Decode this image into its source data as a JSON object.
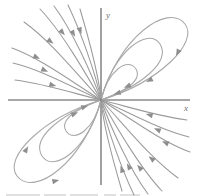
{
  "figure": {
    "axis_labels": {
      "x": "x",
      "y": "y"
    },
    "caption_fragment": ""
  },
  "colors": {
    "background": "#ffffff",
    "axis": "#8a8a8a",
    "trajectory": "#9b9b9b",
    "trajectory_light": "#a8a8a8",
    "arrow": "#8e8e8e",
    "label": "#6f6f6f"
  },
  "chart_data": {
    "type": "line",
    "xlabel": "x",
    "ylabel": "y",
    "grid": false,
    "legend": null,
    "xlim": [
      -1,
      1
    ],
    "ylim": [
      -1,
      1
    ],
    "origin_px": {
      "x": 101,
      "y": 100
    },
    "axes": {
      "x_axis": {
        "x1": 8,
        "y1": 100,
        "x2": 190,
        "y2": 100
      },
      "y_axis": {
        "x1": 101,
        "y1": 8,
        "x2": 101,
        "y2": 185
      }
    },
    "label_positions": {
      "x": {
        "x": 184,
        "y": 111
      },
      "y": {
        "x": 106,
        "y": 18
      }
    },
    "series": [
      {
        "name": "loop-upper-right-outer",
        "kind": "loop",
        "quadrant": "upper-right",
        "path": "M 101 100 C 118 38, 168 2, 185 24 C 199 42, 160 82, 101 100",
        "arrows": [
          {
            "x": 178,
            "y": 52,
            "angle": 118
          },
          {
            "x": 150,
            "y": 80,
            "angle": 152
          }
        ]
      },
      {
        "name": "loop-upper-right-middle",
        "kind": "loop",
        "quadrant": "upper-right",
        "path": "M 101 100 C 113 52, 148 26, 160 44 C 171 62, 141 86, 101 100",
        "arrows": [
          {
            "x": 128,
            "y": 86,
            "angle": 158
          }
        ]
      },
      {
        "name": "loop-upper-right-inner",
        "kind": "loop",
        "quadrant": "upper-right",
        "path": "M 101 100 C 108 70, 128 57, 136 69 C 143 81, 123 92, 101 100",
        "arrows": [
          {
            "x": 118,
            "y": 93,
            "angle": 162
          }
        ]
      },
      {
        "name": "loop-lower-left-outer",
        "kind": "loop",
        "quadrant": "lower-left",
        "path": "M 101 100 C 84 162, 34 198, 17 176 C 3 158, 42 118, 101 100",
        "arrows": [
          {
            "x": 55,
            "y": 181,
            "angle": 348
          },
          {
            "x": 26,
            "y": 150,
            "angle": 300
          }
        ]
      },
      {
        "name": "loop-lower-left-middle",
        "kind": "loop",
        "quadrant": "lower-left",
        "path": "M 101 100 C 89 148, 54 174, 42 156 C 31 138, 61 114, 101 100",
        "arrows": [
          {
            "x": 74,
            "y": 114,
            "angle": 338
          }
        ]
      },
      {
        "name": "loop-lower-left-inner",
        "kind": "loop",
        "quadrant": "lower-left",
        "path": "M 101 100 C 94 130, 74 143, 66 131 C 59 119, 79 108, 101 100",
        "arrows": [
          {
            "x": 84,
            "y": 107,
            "angle": 342
          }
        ]
      },
      {
        "name": "ray-upper-left-1",
        "kind": "ray",
        "quadrant": "upper-left",
        "path": "M 12 48 C 40 58, 72 82, 101 100",
        "arrows": [
          {
            "x": 36,
            "y": 57,
            "angle": 24
          }
        ]
      },
      {
        "name": "ray-upper-left-2",
        "kind": "ray",
        "quadrant": "upper-left",
        "path": "M 13 63 C 42 70, 74 88, 101 100",
        "arrows": [
          {
            "x": 44,
            "y": 70,
            "angle": 22
          }
        ]
      },
      {
        "name": "ray-upper-left-3",
        "kind": "ray",
        "quadrant": "upper-left",
        "path": "M 15 80 C 46 84, 76 94, 101 100",
        "arrows": [
          {
            "x": 52,
            "y": 85,
            "angle": 14
          }
        ]
      },
      {
        "name": "ray-upper-left-4",
        "kind": "ray",
        "quadrant": "upper-left",
        "path": "M 24 22 C 52 42, 80 78, 101 100",
        "arrows": [
          {
            "x": 50,
            "y": 41,
            "angle": 38
          }
        ]
      },
      {
        "name": "ray-upper-left-5",
        "kind": "ray",
        "quadrant": "upper-left",
        "path": "M 40 9 C 62 32, 86 74, 101 100",
        "arrows": [
          {
            "x": 62,
            "y": 32,
            "angle": 50
          }
        ]
      },
      {
        "name": "ray-upper-left-6",
        "kind": "ray",
        "quadrant": "upper-left",
        "path": "M 54 6 C 72 30, 92 74, 101 100",
        "arrows": [
          {
            "x": 73,
            "y": 33,
            "angle": 60
          }
        ]
      },
      {
        "name": "ray-upper-left-7",
        "kind": "ray",
        "quadrant": "upper-left",
        "path": "M 68 5 C 80 30, 96 74, 101 100",
        "arrows": [
          {
            "x": 80,
            "y": 30,
            "angle": 70
          }
        ]
      },
      {
        "name": "ray-upper-left-8",
        "kind": "ray",
        "quadrant": "upper-left",
        "path": "M 80 9 C 88 36, 99 76, 101 100",
        "arrows": []
      },
      {
        "name": "ray-lower-right-1",
        "kind": "ray",
        "quadrant": "lower-right",
        "path": "M 190 152 C 162 142, 130 118, 101 100",
        "arrows": [
          {
            "x": 166,
            "y": 143,
            "angle": 204
          }
        ]
      },
      {
        "name": "ray-lower-right-2",
        "kind": "ray",
        "quadrant": "lower-right",
        "path": "M 189 137 C 160 130, 128 112, 101 100",
        "arrows": [
          {
            "x": 158,
            "y": 130,
            "angle": 202
          }
        ]
      },
      {
        "name": "ray-lower-right-3",
        "kind": "ray",
        "quadrant": "lower-right",
        "path": "M 187 120 C 156 116, 126 106, 101 100",
        "arrows": [
          {
            "x": 150,
            "y": 115,
            "angle": 194
          }
        ]
      },
      {
        "name": "ray-lower-right-4",
        "kind": "ray",
        "quadrant": "lower-right",
        "path": "M 178 178 C 150 158, 122 122, 101 100",
        "arrows": [
          {
            "x": 152,
            "y": 159,
            "angle": 218
          }
        ]
      },
      {
        "name": "ray-lower-right-5",
        "kind": "ray",
        "quadrant": "lower-right",
        "path": "M 162 191 C 140 168, 116 126, 101 100",
        "arrows": [
          {
            "x": 140,
            "y": 168,
            "angle": 230
          }
        ]
      },
      {
        "name": "ray-lower-right-6",
        "kind": "ray",
        "quadrant": "lower-right",
        "path": "M 148 194 C 130 170, 110 126, 101 100",
        "arrows": [
          {
            "x": 129,
            "y": 167,
            "angle": 240
          }
        ]
      },
      {
        "name": "ray-lower-right-7",
        "kind": "ray",
        "quadrant": "lower-right",
        "path": "M 134 195 C 122 170, 106 126, 101 100",
        "arrows": [
          {
            "x": 122,
            "y": 170,
            "angle": 250
          }
        ]
      },
      {
        "name": "ray-lower-right-8",
        "kind": "ray",
        "quadrant": "lower-right",
        "path": "M 122 191 C 114 164, 103 124, 101 100",
        "arrows": []
      }
    ]
  }
}
